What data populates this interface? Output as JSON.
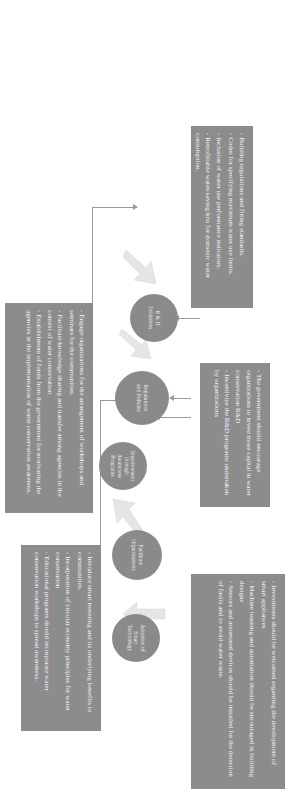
{
  "diagram": {
    "type": "flowchart",
    "title": "",
    "orientation": "landscape figure displayed rotated 90 degrees",
    "colors": {
      "node_fill": "#8a8a8a",
      "box_fill": "#8c8c8c",
      "text": "#f4f4f4",
      "connector": "#9a9a9a",
      "block_arrow": "#e3e3e3",
      "background": "#ffffff"
    },
    "nodes": [
      {
        "id": "improvement",
        "label_lines": [
          "Improvement",
          "through",
          "Awareness",
          "Programs"
        ]
      },
      {
        "id": "regulations",
        "label_lines": [
          "Regulations",
          "and Policies"
        ]
      },
      {
        "id": "rnd",
        "label_lines": [
          "R & D",
          "Initiatives"
        ]
      },
      {
        "id": "facilitate",
        "label_lines": [
          "Facilitate",
          "Organizations"
        ]
      },
      {
        "id": "adoption",
        "label_lines": [
          "Adoption of",
          "Smart",
          "Technology"
        ]
      }
    ],
    "boxes": [
      {
        "id": "box-regulations",
        "for_node": "regulations",
        "bullets": [
          "- Building regulations and fitting standards.",
          "- Codes for specifying maximum water use limits.",
          "- Inclusion of water use performance indicators.",
          "- Retrofittable water-saving kits for domestic water consumption."
        ]
      },
      {
        "id": "box-rnd",
        "for_node": "rnd",
        "bullets": [
          "- The government should encourage organizations to invest more capital in water conservation R&D",
          "- Incentivize the R&D programs undertaken by organizations"
        ]
      },
      {
        "id": "box-adoption",
        "for_node": "adoption",
        "bullets": [
          "- Investments should be welcomed regarding the development of smart appliances",
          "- Machine learning and automation should be encouraged in building designs",
          "- Sensors and automated devices should be installed for the detection of faults and to avoid water waste."
        ]
      },
      {
        "id": "box-improvement",
        "for_node": "improvement",
        "bullets": [
          "- Introduce smart metering and its underlying benefits to communities.",
          "- Incorporation of circular economy principles for water conservation",
          "- Educational programs should incorporate water conservation workshops to spread awareness."
        ]
      },
      {
        "id": "box-facilitate",
        "for_node": "facilitate",
        "bullets": [
          "- Engage organizations for the arrangement of workshops and seminars for the communities.",
          "- Facilitate knowledge sharing and transfer among agencies in the context of water conservation",
          "- Establishment of funds from the government for motivating the agencies in the implementation of water conservation awareness."
        ]
      }
    ],
    "flow_arrows": [
      {
        "from": "improvement",
        "to": "regulations"
      },
      {
        "from": "regulations",
        "to": "rnd"
      },
      {
        "from": "facilitate",
        "to": "improvement"
      },
      {
        "from": "adoption",
        "to": "facilitate"
      }
    ]
  }
}
